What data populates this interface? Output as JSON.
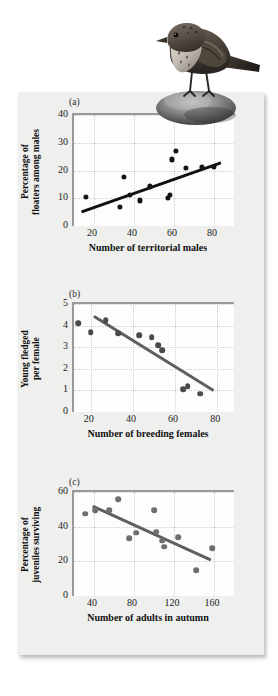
{
  "figure": {
    "illustration_name": "song-sparrow-on-rock",
    "background_color": "#efefee",
    "panel_color": "#fdfdfd"
  },
  "chart_data": [
    {
      "type": "scatter",
      "panel_label": "(a)",
      "title": "",
      "xlabel": "Number of territorial males",
      "ylabel": "Percentage of\nfloaters among males",
      "xlim": [
        10,
        90
      ],
      "ylim": [
        0,
        40
      ],
      "xticks": [
        20,
        40,
        60,
        80
      ],
      "yticks": [
        0,
        10,
        20,
        30,
        40
      ],
      "grid": true,
      "point_color": "#141414",
      "trend_color": "#111111",
      "points": [
        {
          "x": 16,
          "y": 10.6
        },
        {
          "x": 33,
          "y": 7.0
        },
        {
          "x": 35,
          "y": 17.8
        },
        {
          "x": 38,
          "y": 11.1
        },
        {
          "x": 43,
          "y": 9.2
        },
        {
          "x": 48,
          "y": 14.3
        },
        {
          "x": 57,
          "y": 10.1
        },
        {
          "x": 58,
          "y": 11.3
        },
        {
          "x": 59,
          "y": 24.0
        },
        {
          "x": 61,
          "y": 27.0
        },
        {
          "x": 66,
          "y": 20.8
        },
        {
          "x": 74,
          "y": 21.2
        },
        {
          "x": 80,
          "y": 21.2
        }
      ],
      "trendline": {
        "x1": 14,
        "y1": 5.0,
        "x2": 84,
        "y2": 22.8
      }
    },
    {
      "type": "scatter",
      "panel_label": "(b)",
      "title": "",
      "xlabel": "Number of breeding females",
      "ylabel": "Young fledged\nper female",
      "xlim": [
        12,
        88
      ],
      "ylim": [
        0,
        5
      ],
      "xticks": [
        20,
        40,
        60,
        80
      ],
      "yticks": [
        0,
        1,
        2,
        3,
        4,
        5
      ],
      "grid": true,
      "point_color": "#4a4a4a",
      "trend_color": "#5f5f5f",
      "points": [
        {
          "x": 14,
          "y": 4.1
        },
        {
          "x": 20,
          "y": 3.7
        },
        {
          "x": 27,
          "y": 4.25
        },
        {
          "x": 33,
          "y": 3.65
        },
        {
          "x": 43,
          "y": 3.55
        },
        {
          "x": 49,
          "y": 3.45
        },
        {
          "x": 52,
          "y": 3.1
        },
        {
          "x": 54,
          "y": 2.85
        },
        {
          "x": 64,
          "y": 1.05
        },
        {
          "x": 66,
          "y": 1.2
        },
        {
          "x": 72,
          "y": 0.85
        }
      ],
      "trendline": {
        "x1": 21,
        "y1": 4.45,
        "x2": 78,
        "y2": 1.0
      }
    },
    {
      "type": "scatter",
      "panel_label": "(c)",
      "title": "",
      "xlabel": "Number of adults in autumn",
      "ylabel": "Percentage of\njuveniles surviving",
      "xlim": [
        20,
        180
      ],
      "ylim": [
        0,
        60
      ],
      "xticks": [
        40,
        80,
        120,
        160
      ],
      "yticks": [
        0,
        20,
        40,
        60
      ],
      "grid": true,
      "point_color": "#6e6e6e",
      "trend_color": "#5f5f5f",
      "points": [
        {
          "x": 31,
          "y": 47.5
        },
        {
          "x": 41,
          "y": 49.5
        },
        {
          "x": 55,
          "y": 49.5
        },
        {
          "x": 64,
          "y": 56.0
        },
        {
          "x": 75,
          "y": 33.5
        },
        {
          "x": 82,
          "y": 36.5
        },
        {
          "x": 100,
          "y": 49.5
        },
        {
          "x": 102,
          "y": 37.0
        },
        {
          "x": 108,
          "y": 32.0
        },
        {
          "x": 110,
          "y": 28.5
        },
        {
          "x": 124,
          "y": 34.0
        },
        {
          "x": 142,
          "y": 15.0
        },
        {
          "x": 158,
          "y": 27.5
        }
      ],
      "trendline": {
        "x1": 38,
        "y1": 52.0,
        "x2": 156,
        "y2": 21.0
      }
    }
  ]
}
